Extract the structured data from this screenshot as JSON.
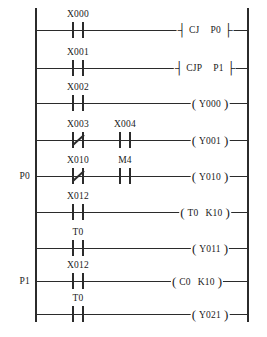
{
  "diagram": {
    "type": "ladder-logic",
    "ink_color": "#2b2b2b",
    "background_color": "#ffffff",
    "rail_left_x": 35,
    "rail_right_x": 247,
    "rail_top_y": 8,
    "rail_bottom_y": 322
  },
  "rungs": [
    {
      "index": 0,
      "y": 30,
      "pointer_label": "",
      "contacts": [
        {
          "label": "X000",
          "x": 78,
          "type": "NO"
        }
      ],
      "output": {
        "style": "bracket",
        "x": 205,
        "mnemonic": "CJ",
        "operand": "P0",
        "operand2": ""
      }
    },
    {
      "index": 1,
      "y": 68,
      "pointer_label": "",
      "contacts": [
        {
          "label": "X001",
          "x": 78,
          "type": "NO"
        }
      ],
      "output": {
        "style": "bracket",
        "x": 205,
        "mnemonic": "CJP",
        "operand": "P1",
        "operand2": ""
      }
    },
    {
      "index": 2,
      "y": 103,
      "pointer_label": "",
      "contacts": [
        {
          "label": "X002",
          "x": 78,
          "type": "NO"
        }
      ],
      "output": {
        "style": "coil",
        "x": 210,
        "mnemonic": "Y000",
        "operand": "",
        "operand2": ""
      }
    },
    {
      "index": 3,
      "y": 140,
      "pointer_label": "",
      "contacts": [
        {
          "label": "X003",
          "x": 78,
          "type": "NC"
        },
        {
          "label": "X004",
          "x": 125,
          "type": "NO"
        }
      ],
      "output": {
        "style": "coil",
        "x": 210,
        "mnemonic": "Y001",
        "operand": "",
        "operand2": ""
      }
    },
    {
      "index": 4,
      "y": 176,
      "pointer_label": "P0",
      "contacts": [
        {
          "label": "X010",
          "x": 78,
          "type": "NC"
        },
        {
          "label": "M4",
          "x": 125,
          "type": "NO"
        }
      ],
      "output": {
        "style": "coil",
        "x": 210,
        "mnemonic": "Y010",
        "operand": "",
        "operand2": ""
      }
    },
    {
      "index": 5,
      "y": 212,
      "pointer_label": "",
      "contacts": [
        {
          "label": "X012",
          "x": 78,
          "type": "NO"
        }
      ],
      "output": {
        "style": "coil",
        "x": 205,
        "mnemonic": "T0",
        "operand": "K10",
        "operand2": ""
      }
    },
    {
      "index": 6,
      "y": 248,
      "pointer_label": "",
      "contacts": [
        {
          "label": "T0",
          "x": 78,
          "type": "NO"
        }
      ],
      "output": {
        "style": "coil",
        "x": 210,
        "mnemonic": "Y011",
        "operand": "",
        "operand2": ""
      }
    },
    {
      "index": 7,
      "y": 281,
      "pointer_label": "P1",
      "contacts": [
        {
          "label": "X012",
          "x": 78,
          "type": "NO"
        }
      ],
      "output": {
        "style": "coil",
        "x": 197,
        "mnemonic": "C0",
        "operand": "K10",
        "operand2": ""
      }
    },
    {
      "index": 8,
      "y": 314,
      "pointer_label": "",
      "contacts": [
        {
          "label": "T0",
          "x": 78,
          "type": "NO"
        }
      ],
      "output": {
        "style": "coil",
        "x": 210,
        "mnemonic": "Y021",
        "operand": "",
        "operand2": ""
      }
    }
  ]
}
